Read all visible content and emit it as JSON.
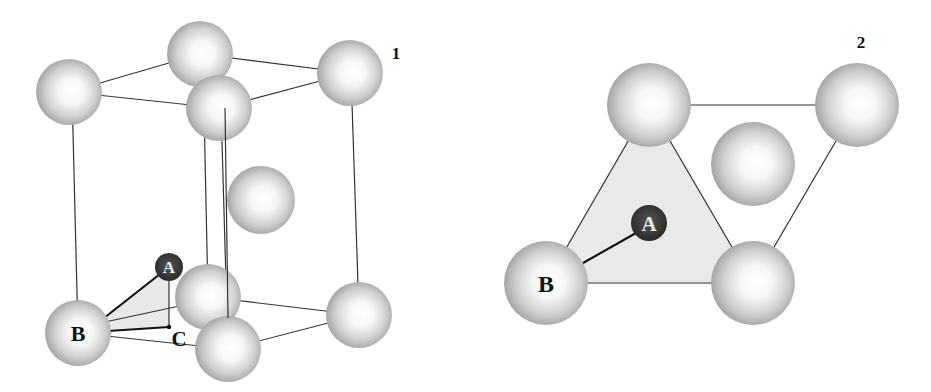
{
  "figure": {
    "colors": {
      "background": "#ffffff",
      "atom_light": "#ffffff",
      "atom_mid": "#d8d8d8",
      "atom_dark": "#9a9a9a",
      "interstitial": "#3a3a3a",
      "triangle_fill": "#e9e9e9",
      "edge": "#333333"
    },
    "panels": [
      {
        "id": "panel-1",
        "label": "1",
        "label_pos": [
          395,
          58
        ],
        "description": "HCP unit cell with interstitial atom A above basal atom B; C marks projection of A onto basal plane",
        "atoms": [
          {
            "name": "top-left",
            "x": 69,
            "y": 92,
            "r": 33
          },
          {
            "name": "top-back",
            "x": 200,
            "y": 54,
            "r": 33
          },
          {
            "name": "top-right",
            "x": 350,
            "y": 73,
            "r": 33
          },
          {
            "name": "top-front",
            "x": 219,
            "y": 108,
            "r": 33
          },
          {
            "name": "middle",
            "x": 261,
            "y": 200,
            "r": 34
          },
          {
            "name": "bottom-back",
            "x": 208,
            "y": 297,
            "r": 33
          },
          {
            "name": "bottom-right",
            "x": 359,
            "y": 315,
            "r": 33
          },
          {
            "name": "B",
            "x": 78,
            "y": 333,
            "r": 33
          },
          {
            "name": "bottom-front",
            "x": 228,
            "y": 349,
            "r": 33
          }
        ],
        "interstitial": {
          "name": "A",
          "x": 169,
          "y": 267,
          "r": 14,
          "label": "A"
        },
        "atom_label_B": "B",
        "point_C": {
          "x": 169,
          "y": 327,
          "label": "C"
        }
      },
      {
        "id": "panel-2",
        "label": "2",
        "label_pos": [
          861,
          47
        ],
        "description": "Basal plane projection showing interstitial A within triangle of atoms, bonded to B",
        "atoms": [
          {
            "name": "top-left",
            "x": 649,
            "y": 105,
            "r": 42
          },
          {
            "name": "top-right",
            "x": 857,
            "y": 105,
            "r": 42
          },
          {
            "name": "middle",
            "x": 753,
            "y": 164,
            "r": 42
          },
          {
            "name": "B",
            "x": 546,
            "y": 283,
            "r": 42
          },
          {
            "name": "bottom-right",
            "x": 753,
            "y": 283,
            "r": 42
          }
        ],
        "interstitial": {
          "name": "A",
          "x": 649,
          "y": 223,
          "r": 18,
          "label": "A"
        },
        "atom_label_B": "B"
      }
    ]
  }
}
